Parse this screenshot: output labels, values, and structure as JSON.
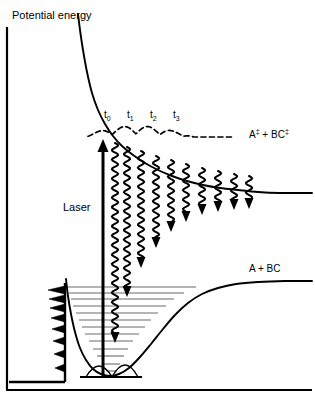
{
  "figure": {
    "background_color": "#ffffff",
    "stroke_color": "#000000",
    "level_color": "#6b6b6b",
    "width": 315,
    "height": 405
  },
  "axis": {
    "y_label": "Potential energy",
    "y_axis_x": 7,
    "y_axis_top": 27,
    "y_axis_bottom": 390,
    "x_axis_y": 390,
    "x_axis_left": 7,
    "x_axis_right": 312
  },
  "labels": {
    "laser": "Laser",
    "upper_state": "A‡ + BC‡",
    "upper_state_base": "A",
    "upper_state_dagger": "‡",
    "upper_state_middle": " + BC",
    "lower_state": "A + BC"
  },
  "time_markers": [
    {
      "id": "t0",
      "base": "t",
      "sub": "0",
      "x": 104
    },
    {
      "id": "t1",
      "base": "t",
      "sub": "1",
      "x": 127
    },
    {
      "id": "t2",
      "base": "t",
      "sub": "2",
      "x": 150
    },
    {
      "id": "t3",
      "base": "t",
      "sub": "3",
      "x": 173
    }
  ],
  "chart_data": {
    "type": "line",
    "title": "Potential energy",
    "xlabel": "",
    "ylabel": "Potential energy",
    "grid": false,
    "legend": "none",
    "note": "Femtochemistry pump-probe scheme: a laser transition from the bound A-BC ground-state well to a repulsive excited-state surface, with a wavepacket evolving in time (t0..t3) and probe (wavy) transitions of decreasing energy gap.",
    "series": [
      {
        "name": "upper-repulsive-curve",
        "label": "A‡ + BC‡",
        "style": "solid",
        "asymptote_y": 193,
        "points": [
          [
            78,
            14
          ],
          [
            80,
            30
          ],
          [
            83,
            50
          ],
          [
            87,
            72
          ],
          [
            92,
            93
          ],
          [
            98,
            110
          ],
          [
            105,
            124
          ],
          [
            113,
            136
          ],
          [
            122,
            146
          ],
          [
            133,
            155
          ],
          [
            145,
            163
          ],
          [
            158,
            170
          ],
          [
            172,
            176
          ],
          [
            187,
            181
          ],
          [
            203,
            185
          ],
          [
            220,
            188
          ],
          [
            238,
            190
          ],
          [
            258,
            192
          ],
          [
            280,
            193
          ],
          [
            312,
            193
          ]
        ]
      },
      {
        "name": "lower-morse-curve",
        "label": "A + BC",
        "style": "solid",
        "asymptote_y": 281,
        "well_minimum": [
          112,
          376
        ],
        "points": [
          [
            66,
            279
          ],
          [
            68,
            296
          ],
          [
            71,
            314
          ],
          [
            75,
            332
          ],
          [
            80,
            348
          ],
          [
            86,
            360
          ],
          [
            93,
            369
          ],
          [
            101,
            374
          ],
          [
            110,
            376
          ],
          [
            119,
            374
          ],
          [
            129,
            368
          ],
          [
            140,
            357
          ],
          [
            151,
            344
          ],
          [
            163,
            329
          ],
          [
            175,
            315
          ],
          [
            188,
            303
          ],
          [
            202,
            294
          ],
          [
            218,
            288
          ],
          [
            236,
            284
          ],
          [
            258,
            282
          ],
          [
            285,
            281
          ],
          [
            312,
            281
          ]
        ]
      }
    ],
    "laser_arrow": {
      "name": "laser-excitation-arrow",
      "x": 103,
      "y_start": 378,
      "y_end": 139,
      "direction": "up",
      "line_width": 3
    },
    "wavepacket_upper": {
      "name": "dashed-wavepacket",
      "style": "dashed",
      "x_start": 88,
      "x_end": 232,
      "baseline_y": 137,
      "amplitude": 8,
      "lobes": 6
    },
    "wavepacket_well": {
      "name": "ground-state-wavepacket",
      "x_start": 86,
      "x_end": 138,
      "baseline_y": 377,
      "peaks": 2
    },
    "probe_arrows": {
      "name": "probe-transition-arrows",
      "style": "wavy-down",
      "count": 10,
      "x_positions": [
        115,
        127,
        141,
        156,
        171,
        186,
        202,
        218,
        234,
        249
      ],
      "y_start": [
        143,
        147,
        151,
        156,
        160,
        164,
        168,
        171,
        174,
        176
      ],
      "y_tip": [
        343,
        297,
        268,
        248,
        232,
        222,
        215,
        212,
        210,
        209
      ]
    },
    "vibrational_levels": {
      "name": "vibrational-energy-levels",
      "count": 13,
      "y_values": [
        287,
        293,
        299,
        306,
        313,
        320,
        327,
        334,
        341,
        349,
        356,
        364,
        371
      ],
      "x_left": [
        67,
        69,
        71,
        73,
        76,
        79,
        82,
        85,
        89,
        93,
        97,
        102,
        107
      ],
      "x_right": [
        196,
        184,
        174,
        166,
        158,
        151,
        145,
        139,
        133,
        128,
        124,
        120,
        117
      ]
    },
    "spectrum_spikes": {
      "name": "emission-spectrum-spikes",
      "baseline_x": 65,
      "baseline_y_bottom": 382,
      "baseline_y_top": 283,
      "floor_y": 382,
      "floor_x_left": 9,
      "spikes": [
        {
          "y": 290,
          "length": 17
        },
        {
          "y": 299,
          "length": 16
        },
        {
          "y": 308,
          "length": 15
        },
        {
          "y": 318,
          "length": 14
        },
        {
          "y": 329,
          "length": 13
        },
        {
          "y": 341,
          "length": 12
        },
        {
          "y": 354,
          "length": 11
        },
        {
          "y": 368,
          "length": 10
        }
      ]
    }
  }
}
